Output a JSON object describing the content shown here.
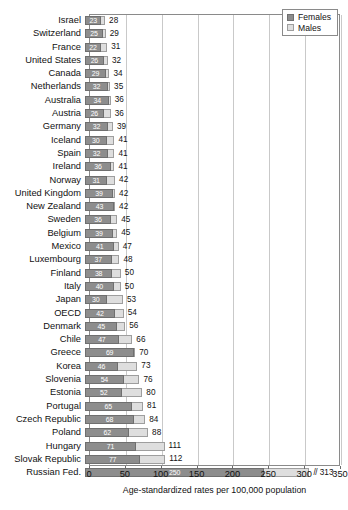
{
  "chart_data": {
    "type": "bar",
    "orientation": "horizontal",
    "stacked": true,
    "title": "",
    "xlabel": "Age-standardized rates per 100,000 population",
    "ylabel": "",
    "xlim": [
      0,
      350
    ],
    "xticks": [
      0,
      50,
      100,
      150,
      200,
      250,
      300,
      350
    ],
    "grid": true,
    "legend_position": "top-right",
    "categories": [
      "Israel",
      "Switzerland",
      "France",
      "United States",
      "Canada",
      "Netherlands",
      "Australia",
      "Austria",
      "Germany",
      "Iceland",
      "Spain",
      "Ireland",
      "Norway",
      "United Kingdom",
      "New Zealand",
      "Sweden",
      "Belgium",
      "Mexico",
      "Luxembourg",
      "Finland",
      "Italy",
      "Japan",
      "OECD",
      "Denmark",
      "Chile",
      "Greece",
      "Korea",
      "Slovenia",
      "Estonia",
      "Portugal",
      "Czech Republic",
      "Poland",
      "Hungary",
      "Slovak Republic",
      "Russian Fed."
    ],
    "series": [
      {
        "name": "Females",
        "color": "#8d8d8d",
        "values": [
          23,
          25,
          22,
          26,
          29,
          32,
          34,
          26,
          32,
          30,
          32,
          36,
          31,
          39,
          43,
          36,
          39,
          41,
          37,
          38,
          40,
          30,
          42,
          45,
          47,
          69,
          46,
          54,
          52,
          65,
          68,
          62,
          71,
          77,
          250
        ]
      },
      {
        "name": "Males",
        "color": "#dedede",
        "values": [
          5,
          4,
          9,
          6,
          5,
          3,
          2,
          10,
          7,
          11,
          9,
          5,
          11,
          3,
          -1,
          9,
          6,
          6,
          11,
          12,
          10,
          23,
          12,
          11,
          19,
          1,
          27,
          22,
          28,
          16,
          16,
          26,
          40,
          35,
          63
        ]
      }
    ],
    "totals": [
      28,
      29,
      31,
      32,
      34,
      35,
      36,
      36,
      39,
      41,
      41,
      41,
      42,
      42,
      42,
      45,
      45,
      47,
      48,
      50,
      50,
      53,
      54,
      56,
      66,
      70,
      73,
      76,
      80,
      81,
      84,
      88,
      111,
      112,
      313
    ],
    "total_label_prefix": {
      "Russian Fed.": "//"
    }
  },
  "legend": {
    "items": [
      {
        "label": "Females",
        "swatch": "females-swatch"
      },
      {
        "label": "Males",
        "swatch": "males-swatch"
      }
    ]
  }
}
